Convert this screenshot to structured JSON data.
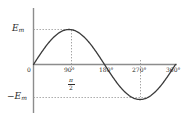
{
  "figure": {
    "type": "sine-waveform-plot"
  },
  "axes": {
    "y_axis_name": "y-axis",
    "x_axis_name": "x-axis",
    "origin_label": "0",
    "y_labels": {
      "positive_peak": "E",
      "positive_peak_sub": "m",
      "negative_peak": "−E",
      "negative_peak_sub": "m"
    },
    "x_ticks": [
      {
        "label": "90°"
      },
      {
        "label": "180°"
      },
      {
        "label": "270°"
      },
      {
        "label": "360°"
      }
    ],
    "radian_label": {
      "numerator": "π",
      "denominator": "2"
    }
  },
  "colors": {
    "curve": "#3b3b3b",
    "axis": "#8c8c8c",
    "guide": "#9a9a9a",
    "text": "#2b2b2b",
    "background": "#ffffff"
  },
  "chart_data": {
    "type": "line",
    "title": "",
    "xlabel": "",
    "ylabel": "",
    "x": [
      0,
      45,
      90,
      135,
      180,
      225,
      270,
      315,
      360
    ],
    "x_tick_labels": [
      "0",
      "90°",
      "180°",
      "270°",
      "360°"
    ],
    "x_tick_values": [
      0,
      90,
      180,
      270,
      360
    ],
    "values": [
      0,
      0.707,
      1.0,
      0.707,
      0,
      -0.707,
      -1.0,
      -0.707,
      0
    ],
    "y_tick_labels": [
      "E_m",
      "0",
      "-E_m"
    ],
    "y_tick_values": [
      1,
      0,
      -1
    ],
    "ylim": [
      -1.25,
      1.25
    ],
    "xlim": [
      0,
      380
    ],
    "grid": false,
    "legend": "none",
    "annotations": [
      {
        "text": "E_m",
        "x": 0,
        "y": 1,
        "note": "peak amplitude guide line"
      },
      {
        "text": "-E_m",
        "x": 0,
        "y": -1,
        "note": "trough amplitude guide line"
      },
      {
        "text": "π/2",
        "x": 90,
        "y": 0,
        "note": "radian equivalent of 90 degrees"
      }
    ]
  }
}
